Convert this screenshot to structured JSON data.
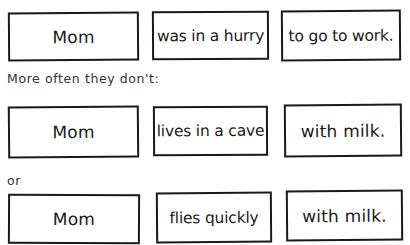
{
  "rows": [
    {
      "caption": null,
      "boxes": [
        {
          "text": "Mom"
        },
        {
          "text": "was in a hurry"
        },
        {
          "text": "to go to work."
        }
      ]
    },
    {
      "caption": "More often they don't:",
      "boxes": [
        {
          "text": "Mom"
        },
        {
          "text": "lives in a cave"
        },
        {
          "text": "with milk."
        }
      ]
    },
    {
      "caption": "or",
      "boxes": [
        {
          "text": "Mom"
        },
        {
          "text": "flies quickly"
        },
        {
          "text": "with milk."
        }
      ]
    }
  ]
}
